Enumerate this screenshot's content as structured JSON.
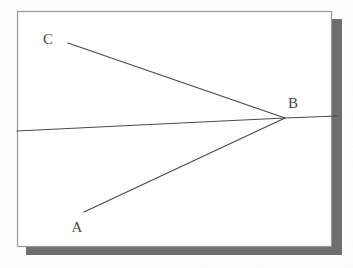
{
  "figure": {
    "kind": "ray-diagram",
    "caption_visible": false,
    "canvas": {
      "width": 353,
      "height": 268
    },
    "frame": {
      "name": "diagram-frame",
      "x": 17,
      "y": 11,
      "width": 315,
      "height": 236,
      "border_color": "#9a9a9a",
      "fill_color": "#ffffff",
      "shadow_color": "#6e6e6e",
      "shadow_offset_x": 9,
      "shadow_offset_y": 8
    },
    "background_color": "#fdfdfd",
    "line_color": "#4a4a4a",
    "points": [
      {
        "id": "A",
        "label": "A",
        "label_x": 77,
        "label_y": 232,
        "x": 84,
        "y": 212
      },
      {
        "id": "B",
        "label": "B",
        "label_x": 293,
        "label_y": 108,
        "x": 285,
        "y": 118
      },
      {
        "id": "C",
        "label": "C",
        "label_x": 48,
        "label_y": 44,
        "x": 68,
        "y": 43
      }
    ],
    "segments": [
      {
        "name": "incident-ray-A-to-B",
        "from": "A",
        "to": "B",
        "x1": 84,
        "y1": 212,
        "x2": 285,
        "y2": 118
      },
      {
        "name": "reflected-ray-B-to-C",
        "from": "B",
        "to": "C",
        "x1": 285,
        "y1": 118,
        "x2": 68,
        "y2": 43
      }
    ],
    "mirror_line": {
      "name": "mirror-surface-line",
      "points": "17,131 160,124 285,118 337,116"
    }
  }
}
